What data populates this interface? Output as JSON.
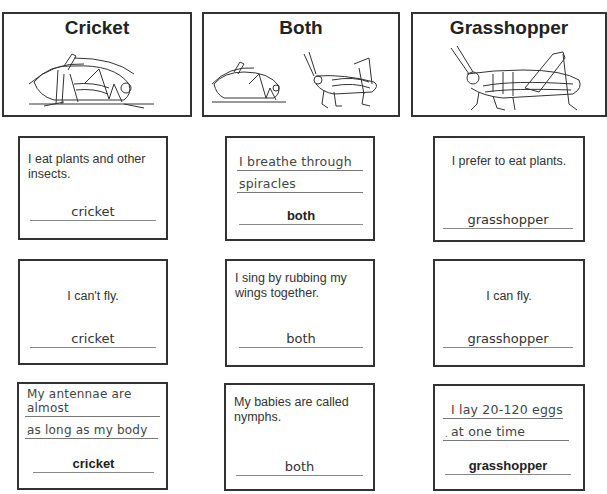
{
  "headers": [
    {
      "title": "Cricket",
      "image": "cricket-illustration"
    },
    {
      "title": "Both",
      "image": "cricket-and-grasshopper-illustration"
    },
    {
      "title": "Grasshopper",
      "image": "grasshopper-illustration"
    }
  ],
  "cards": {
    "row1": {
      "cricket": {
        "statement": "I eat plants and other insects.",
        "answer": "cricket"
      },
      "both": {
        "statement_line1": "I breathe through",
        "statement_line2": "spiracles",
        "punct": ".",
        "answer": "both"
      },
      "grasshopper": {
        "statement": "I prefer to eat plants.",
        "answer": "grasshopper"
      }
    },
    "row2": {
      "cricket": {
        "statement": "I can't fly.",
        "answer": "cricket"
      },
      "both": {
        "statement": "I sing by rubbing my wings together.",
        "answer": "both"
      },
      "grasshopper": {
        "statement": "I can fly.",
        "answer": "grasshopper"
      }
    },
    "row3": {
      "cricket": {
        "statement_line1": "My antennae are almost",
        "statement_line2": "as long as my body",
        "punct": ".",
        "answer": "cricket"
      },
      "both": {
        "statement": "My babies are called nymphs.",
        "answer": "both"
      },
      "grasshopper": {
        "statement_line1": "I lay 20-120 eggs",
        "statement_line2": "at one time",
        "punct": ".",
        "answer": "grasshopper"
      }
    }
  }
}
